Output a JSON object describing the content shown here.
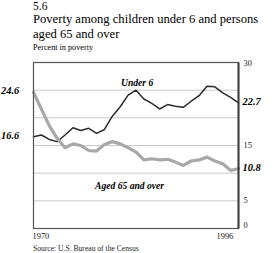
{
  "figure": {
    "number": "5.6",
    "title": "Poverty among children under 6 and persons aged 65 and over",
    "subtitle": "Percent in poverty",
    "source": "Source: U.S. Bureau of the Census"
  },
  "axis": {
    "left_labels": [
      {
        "text": "24.6",
        "value": 24.6
      },
      {
        "text": "16.6",
        "value": 16.6
      }
    ],
    "right_labels": [
      {
        "text": "22.7",
        "value": 22.7
      },
      {
        "text": "10.8",
        "value": 10.8
      }
    ],
    "right_ticks": [
      "30",
      "15",
      "5",
      "0"
    ],
    "x_ticks": [
      "1970",
      "1996"
    ]
  },
  "series_labels": {
    "under6": "Under 6",
    "aged65": "Aged 65 and over"
  },
  "colors": {
    "under6": "#2b2b2b",
    "aged65": "#a8a8a8",
    "grid": "#c9c9c9",
    "frame": "#555555",
    "background": "#ffffff"
  },
  "chart_data": {
    "type": "line",
    "title": "Poverty among children under 6 and persons aged 65 and over",
    "subtitle": "Percent in poverty",
    "xlabel": "",
    "ylabel": "Percent in poverty",
    "xlim": [
      1970,
      1996
    ],
    "ylim": [
      0,
      30
    ],
    "yticks": [
      0,
      5,
      15,
      30
    ],
    "grid": true,
    "legend": "inline-annotations",
    "x": [
      1970,
      1971,
      1972,
      1973,
      1974,
      1975,
      1976,
      1977,
      1978,
      1979,
      1980,
      1981,
      1982,
      1983,
      1984,
      1985,
      1986,
      1987,
      1988,
      1989,
      1990,
      1991,
      1992,
      1993,
      1994,
      1995,
      1996
    ],
    "series": [
      {
        "name": "Under 6",
        "color": "#2b2b2b",
        "start_value": 16.6,
        "end_value": 22.7,
        "values": [
          16.6,
          16.9,
          16.1,
          15.7,
          16.9,
          18.2,
          17.7,
          18.1,
          17.2,
          17.9,
          20.3,
          22.0,
          24.1,
          25.0,
          23.4,
          22.6,
          21.6,
          22.4,
          22.1,
          21.9,
          23.0,
          24.0,
          25.7,
          25.6,
          24.5,
          23.7,
          22.7
        ]
      },
      {
        "name": "Aged 65 and over",
        "color": "#a8a8a8",
        "start_value": 24.6,
        "end_value": 10.8,
        "values": [
          24.6,
          21.6,
          18.6,
          16.3,
          14.6,
          15.3,
          15.0,
          14.1,
          14.0,
          15.2,
          15.7,
          15.3,
          14.6,
          13.8,
          12.4,
          12.6,
          12.4,
          12.5,
          12.0,
          11.4,
          12.2,
          12.4,
          12.9,
          12.2,
          11.7,
          10.5,
          10.8
        ]
      }
    ]
  }
}
